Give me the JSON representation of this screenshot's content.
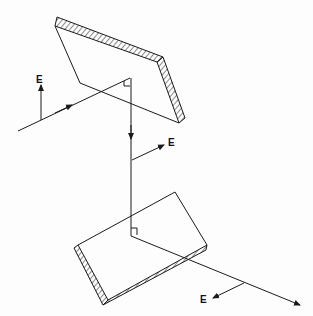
{
  "diagram": {
    "type": "optics-schematic",
    "labels": [
      {
        "id": "e1",
        "text": "E",
        "x": 36,
        "y": 77
      },
      {
        "id": "e2",
        "text": "E",
        "x": 167,
        "y": 138
      },
      {
        "id": "e3",
        "text": "E",
        "x": 206,
        "y": 294
      }
    ],
    "colors": {
      "line": "#1a1a1a",
      "background": "#fdfdfd"
    },
    "elements": [
      "upper-mirror",
      "lower-mirror",
      "incident-ray",
      "vertical-ray",
      "outgoing-ray",
      "e-vector-incident",
      "e-vector-vertical",
      "e-vector-outgoing",
      "right-angle-marker-upper",
      "right-angle-marker-lower"
    ]
  }
}
